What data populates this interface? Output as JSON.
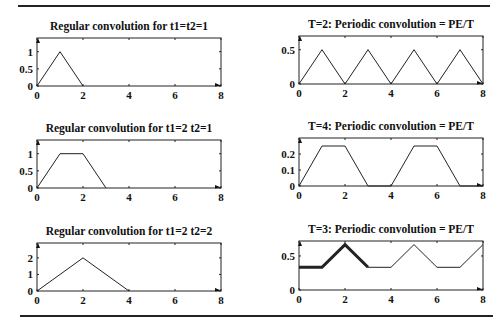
{
  "rules": {
    "top_y": 5,
    "bottom_y": 315
  },
  "chart_data": [
    {
      "type": "line",
      "title": "Regular convolution for t1=t2=1",
      "xlabel": "",
      "ylabel": "",
      "xlim": [
        0,
        8
      ],
      "ylim": [
        0,
        1.4
      ],
      "xticks": [
        0,
        2,
        4,
        6,
        8
      ],
      "yticks": [
        0,
        0.5,
        1
      ],
      "ytick_labels": [
        "0",
        "0.5",
        "1"
      ],
      "grid": false,
      "series": [
        {
          "name": "conv",
          "x": [
            0,
            1,
            2
          ],
          "y": [
            0,
            1,
            0
          ]
        }
      ],
      "box": {
        "x0": 37,
        "x1": 221,
        "y0": 38,
        "y1": 86
      }
    },
    {
      "type": "line",
      "title": "T=2:  Periodic convolution = PE/T",
      "xlabel": "",
      "ylabel": "",
      "xlim": [
        0,
        8
      ],
      "ylim": [
        0,
        0.7
      ],
      "xticks": [
        0,
        2,
        4,
        6,
        8
      ],
      "yticks": [
        0,
        0.5
      ],
      "ytick_labels": [
        "0",
        "0.5"
      ],
      "grid": false,
      "series": [
        {
          "name": "periodic",
          "x": [
            0,
            1,
            2,
            3,
            4,
            5,
            6,
            7,
            8
          ],
          "y": [
            0,
            0.5,
            0,
            0.5,
            0,
            0.5,
            0,
            0.5,
            0
          ]
        }
      ],
      "box": {
        "x0": 299,
        "x1": 483,
        "y0": 36,
        "y1": 84
      }
    },
    {
      "type": "line",
      "title": "Regular convolution for t1=2  t2=1",
      "xlabel": "",
      "ylabel": "",
      "xlim": [
        0,
        8
      ],
      "ylim": [
        0,
        1.4
      ],
      "xticks": [
        0,
        2,
        4,
        6,
        8
      ],
      "yticks": [
        0,
        0.5,
        1
      ],
      "ytick_labels": [
        "0",
        "0.5",
        "1"
      ],
      "grid": false,
      "series": [
        {
          "name": "conv",
          "x": [
            0,
            1,
            2,
            3
          ],
          "y": [
            0,
            1,
            1,
            0
          ]
        }
      ],
      "box": {
        "x0": 37,
        "x1": 221,
        "y0": 140,
        "y1": 188
      }
    },
    {
      "type": "line",
      "title": "T=4: Periodic convolution = PE/T",
      "xlabel": "",
      "ylabel": "",
      "xlim": [
        0,
        8
      ],
      "ylim": [
        0,
        0.3
      ],
      "xticks": [
        0,
        2,
        4,
        6,
        8
      ],
      "yticks": [
        0,
        0.1,
        0.2
      ],
      "ytick_labels": [
        "0",
        "0.1",
        "0.2"
      ],
      "grid": false,
      "series": [
        {
          "name": "periodic",
          "x": [
            0,
            1,
            2,
            3,
            4,
            5,
            6,
            7,
            8
          ],
          "y": [
            0,
            0.25,
            0.25,
            0,
            0,
            0.25,
            0.25,
            0,
            0
          ]
        }
      ],
      "box": {
        "x0": 299,
        "x1": 483,
        "y0": 138,
        "y1": 186
      }
    },
    {
      "type": "line",
      "title": "Regular convolution for t1=2  t2=2",
      "xlabel": "",
      "ylabel": "",
      "xlim": [
        0,
        8
      ],
      "ylim": [
        0,
        2.9
      ],
      "xticks": [
        0,
        2,
        4,
        6,
        8
      ],
      "yticks": [
        0,
        1,
        2
      ],
      "ytick_labels": [
        "0",
        "1",
        "2"
      ],
      "grid": false,
      "series": [
        {
          "name": "conv",
          "x": [
            0,
            2,
            4
          ],
          "y": [
            0,
            2,
            0
          ]
        }
      ],
      "box": {
        "x0": 37,
        "x1": 221,
        "y0": 243,
        "y1": 291
      }
    },
    {
      "type": "line",
      "title": "T=3: Periodic convolution = PE/T",
      "xlabel": "",
      "ylabel": "",
      "xlim": [
        0,
        8
      ],
      "ylim": [
        0,
        0.72
      ],
      "xticks": [
        0,
        2,
        4,
        6,
        8
      ],
      "yticks": [
        0,
        0.5
      ],
      "ytick_labels": [
        "0",
        "0.5"
      ],
      "grid": false,
      "series": [
        {
          "name": "periodic",
          "x": [
            0,
            1,
            2,
            3,
            4,
            5,
            6,
            7,
            8
          ],
          "y": [
            0.333,
            0.333,
            0.667,
            0.333,
            0.333,
            0.667,
            0.333,
            0.333,
            0.667
          ],
          "width": 1
        },
        {
          "name": "one-period-highlight",
          "x": [
            0,
            1,
            2,
            3
          ],
          "y": [
            0.333,
            0.333,
            0.667,
            0.333
          ],
          "width": 3
        }
      ],
      "box": {
        "x0": 299,
        "x1": 483,
        "y0": 241,
        "y1": 290
      }
    }
  ]
}
